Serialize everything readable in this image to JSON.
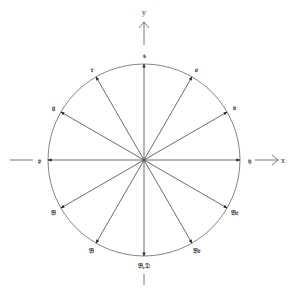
{
  "diagram": {
    "type": "unit-circle-vectors",
    "center": [
      144,
      160
    ],
    "radius": 96,
    "stroke_color": "#555555",
    "axes": {
      "x_label": "x",
      "y_label": "y"
    },
    "vectors": [
      {
        "angle_deg": 90,
        "label": "𝔰"
      },
      {
        "angle_deg": 60,
        "label": "𝔬"
      },
      {
        "angle_deg": 30,
        "label": "𝔳"
      },
      {
        "angle_deg": 0,
        "label": "𝔶"
      },
      {
        "angle_deg": -30,
        "label": "𝔅𝔯"
      },
      {
        "angle_deg": -60,
        "label": "𝔅𝔯"
      },
      {
        "angle_deg": -90,
        "label": "𝔅,𝔇"
      },
      {
        "angle_deg": -120,
        "label": "𝔅"
      },
      {
        "angle_deg": -150,
        "label": "𝔅"
      },
      {
        "angle_deg": 180,
        "label": "𝔭"
      },
      {
        "angle_deg": 150,
        "label": "𝔤"
      },
      {
        "angle_deg": 120,
        "label": "𝔯"
      }
    ]
  }
}
